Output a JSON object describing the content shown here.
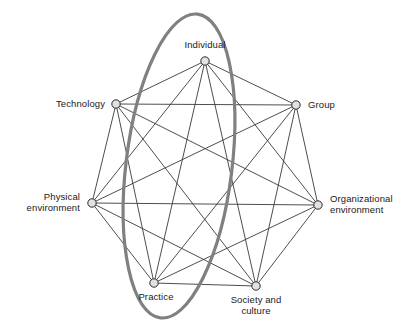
{
  "figure": {
    "type": "network-diagram",
    "background_color": "#ffffff",
    "width": 411,
    "height": 332
  },
  "style": {
    "edge_color": "#3a3a3a",
    "edge_width": 0.9,
    "node_fill": "#e2e2e2",
    "node_stroke": "#2b2b2b",
    "node_radius": 4.2,
    "highlight_color": "#808080",
    "highlight_width": 3.2,
    "label_color": "#1a1a1a"
  },
  "nodes": [
    {
      "id": "individual",
      "label": "Individual",
      "x": 205,
      "y": 61,
      "label_x": 205,
      "label_y": 39,
      "label_align": "center"
    },
    {
      "id": "technology",
      "label": "Technology",
      "x": 116,
      "y": 104,
      "label_x": 105,
      "label_y": 98,
      "label_align": "right"
    },
    {
      "id": "group",
      "label": "Group",
      "x": 296,
      "y": 105,
      "label_x": 308,
      "label_y": 99,
      "label_align": "left"
    },
    {
      "id": "physical-environment",
      "label": "Physical\nenvironment",
      "x": 92,
      "y": 203,
      "label_x": 80,
      "label_y": 191,
      "label_align": "right"
    },
    {
      "id": "organizational-environment",
      "label": "Organizational\nenvironment",
      "x": 318,
      "y": 205,
      "label_x": 330,
      "label_y": 193,
      "label_align": "left"
    },
    {
      "id": "practice",
      "label": "Practice",
      "x": 154,
      "y": 283,
      "label_x": 156,
      "label_y": 291,
      "label_align": "center"
    },
    {
      "id": "society-and-culture",
      "label": "Society and\nculture",
      "x": 256,
      "y": 286,
      "label_x": 256,
      "label_y": 294,
      "label_align": "center"
    }
  ],
  "edges": [
    [
      "individual",
      "technology"
    ],
    [
      "individual",
      "group"
    ],
    [
      "individual",
      "physical-environment"
    ],
    [
      "individual",
      "organizational-environment"
    ],
    [
      "individual",
      "practice"
    ],
    [
      "individual",
      "society-and-culture"
    ],
    [
      "technology",
      "group"
    ],
    [
      "technology",
      "physical-environment"
    ],
    [
      "technology",
      "organizational-environment"
    ],
    [
      "technology",
      "practice"
    ],
    [
      "technology",
      "society-and-culture"
    ],
    [
      "group",
      "physical-environment"
    ],
    [
      "group",
      "organizational-environment"
    ],
    [
      "group",
      "practice"
    ],
    [
      "group",
      "society-and-culture"
    ],
    [
      "physical-environment",
      "organizational-environment"
    ],
    [
      "physical-environment",
      "practice"
    ],
    [
      "physical-environment",
      "society-and-culture"
    ],
    [
      "organizational-environment",
      "practice"
    ],
    [
      "organizational-environment",
      "society-and-culture"
    ],
    [
      "practice",
      "society-and-culture"
    ]
  ],
  "highlight_ellipse": {
    "name": "individual-practice-highlight",
    "cx": 179,
    "cy": 166,
    "rx": 53,
    "ry": 153,
    "rotation_deg": 7,
    "stroke": "#808080",
    "stroke_width": 3.2,
    "fill": "none"
  }
}
